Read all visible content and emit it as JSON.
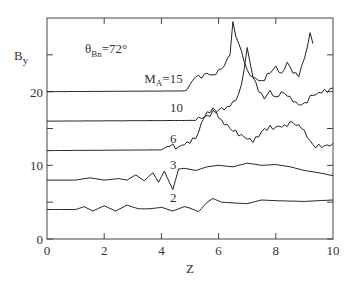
{
  "chart_data": {
    "type": "line",
    "title": "",
    "annotation": {
      "theta_symbol": "θ",
      "theta_sub": "Bn",
      "theta_value": "=72°"
    },
    "xlabel": "Z",
    "ylabel_main": "B",
    "ylabel_sub": "y",
    "xlim": [
      0,
      10
    ],
    "ylim": [
      0,
      30
    ],
    "xticks": [
      0,
      2,
      4,
      6,
      8,
      10
    ],
    "xtick_labels": [
      "0",
      "2",
      "4",
      "6",
      "8",
      "10"
    ],
    "yticks": [
      0,
      10,
      20
    ],
    "ytick_labels": [
      "0",
      "10",
      "20"
    ],
    "yminor_ticks": [
      5,
      15,
      25
    ],
    "grid": false,
    "legend": "inline curve labels",
    "series": [
      {
        "name": "M_A=15",
        "label_main": "M",
        "label_sub": "A",
        "label_value": "=15",
        "label_at": [
          3.4,
          21.2
        ],
        "x": [
          0,
          4.8,
          5.0,
          5.2,
          5.4,
          5.6,
          5.8,
          6.0,
          6.2,
          6.4,
          6.5,
          6.6,
          6.8,
          7.0,
          7.2,
          7.5,
          7.8,
          8.0,
          8.2,
          8.4,
          8.6,
          8.8,
          9.0,
          9.2,
          9.3
        ],
        "y": [
          20,
          20.1,
          21,
          22,
          21.8,
          22.5,
          22.3,
          23,
          23.5,
          25,
          29.5,
          27.5,
          25.5,
          23,
          22,
          21.5,
          22.5,
          23.5,
          22.5,
          24,
          22.5,
          22,
          24.5,
          28,
          26.5
        ]
      },
      {
        "name": "M_A=10",
        "label_value": "10",
        "label_at": [
          4.3,
          17.2
        ],
        "x": [
          0,
          5.2,
          5.6,
          6.0,
          6.3,
          6.6,
          6.8,
          7.0,
          7.2,
          7.4,
          7.6,
          7.8,
          8.0,
          8.2,
          8.4,
          8.6,
          8.8,
          9.0,
          9.3,
          9.6,
          10
        ],
        "y": [
          16,
          16.1,
          16.8,
          17.5,
          18,
          18.8,
          21,
          26,
          22,
          20,
          19,
          20.2,
          19.3,
          20,
          19.4,
          18.6,
          18.2,
          18.5,
          19.5,
          19.8,
          20.5
        ]
      },
      {
        "name": "M_A=6",
        "label_value": "6",
        "label_at": [
          4.3,
          13.0
        ],
        "x": [
          0,
          4.0,
          4.3,
          4.6,
          4.9,
          5.2,
          5.5,
          5.8,
          6.1,
          6.5,
          6.8,
          7.2,
          7.6,
          8.0,
          8.3,
          8.6,
          8.9,
          9.3,
          9.6,
          10
        ],
        "y": [
          12,
          12.1,
          12.6,
          12.5,
          13.2,
          13.6,
          16.5,
          17.8,
          16.2,
          14.6,
          14.2,
          13.1,
          15,
          15.2,
          15.5,
          15.8,
          15,
          12.8,
          12.4,
          13
        ]
      },
      {
        "name": "M_A=3",
        "label_value": "3",
        "label_at": [
          4.3,
          9.5
        ],
        "x": [
          0,
          1.0,
          1.5,
          2.0,
          2.5,
          2.8,
          3.1,
          3.4,
          3.7,
          3.9,
          4.1,
          4.4,
          4.6,
          4.8,
          5.2,
          5.6,
          6.0,
          6.5,
          7.0,
          7.5,
          8.0,
          8.5,
          9.0,
          9.5,
          10
        ],
        "y": [
          8,
          8,
          8.3,
          8,
          8.2,
          8.0,
          8.7,
          7.9,
          9.0,
          7.7,
          9.2,
          6.7,
          9.5,
          9.6,
          9.3,
          9.8,
          10,
          9.8,
          10.3,
          10,
          10.1,
          9.8,
          9.3,
          9.0,
          8.6
        ]
      },
      {
        "name": "M_A=2",
        "label_value": "2",
        "label_at": [
          4.3,
          5.0
        ],
        "x": [
          0,
          1.0,
          1.3,
          1.6,
          2.0,
          2.4,
          2.8,
          3.2,
          3.6,
          4.0,
          4.4,
          4.8,
          5.0,
          5.3,
          5.6,
          5.8,
          6.1,
          6.5,
          7.0,
          7.5,
          8.0,
          9.0,
          10
        ],
        "y": [
          4,
          4,
          4.4,
          3.8,
          4.5,
          3.8,
          4.6,
          4.1,
          4.1,
          4.3,
          3.8,
          4.4,
          4.2,
          3.7,
          5.0,
          5.5,
          5.0,
          4.9,
          4.8,
          5.3,
          5.2,
          5.1,
          5.3
        ]
      }
    ]
  }
}
